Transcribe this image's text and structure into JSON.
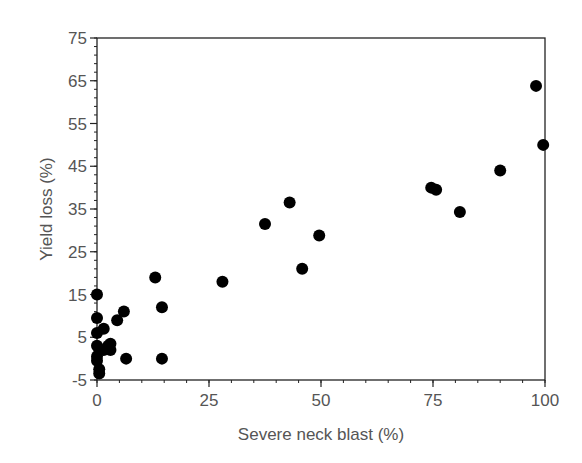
{
  "chart_data": {
    "type": "scatter",
    "title": "",
    "xlabel": "Severe neck blast (%)",
    "ylabel": "Yield loss (%)",
    "xlim": [
      0,
      100
    ],
    "ylim": [
      -5,
      75
    ],
    "x_ticks": [
      0,
      25,
      50,
      75,
      100
    ],
    "y_ticks": [
      -5,
      5,
      15,
      25,
      35,
      45,
      55,
      65,
      75
    ],
    "x_minor_step": 5,
    "y_minor_step": 2,
    "grid": false,
    "legend": null,
    "marker": {
      "shape": "circle",
      "color": "#000000",
      "radius": 6
    },
    "series": [
      {
        "name": "observations",
        "points": [
          {
            "x": 0,
            "y": 15
          },
          {
            "x": 0,
            "y": 9.5
          },
          {
            "x": 0,
            "y": 6
          },
          {
            "x": 1.5,
            "y": 7
          },
          {
            "x": 4.5,
            "y": 9
          },
          {
            "x": 6,
            "y": 11
          },
          {
            "x": 0,
            "y": 3
          },
          {
            "x": 0.5,
            "y": 2
          },
          {
            "x": 1.5,
            "y": 2
          },
          {
            "x": 2.5,
            "y": 3
          },
          {
            "x": 3,
            "y": 3.5
          },
          {
            "x": 3,
            "y": 2
          },
          {
            "x": 0,
            "y": 0.5
          },
          {
            "x": 0,
            "y": -0.5
          },
          {
            "x": 0.5,
            "y": -2.5
          },
          {
            "x": 0.5,
            "y": -3.5
          },
          {
            "x": 6.5,
            "y": 0
          },
          {
            "x": 14.5,
            "y": 0
          },
          {
            "x": 13,
            "y": 19
          },
          {
            "x": 14.5,
            "y": 12
          },
          {
            "x": 28,
            "y": 18
          },
          {
            "x": 37.5,
            "y": 31.5
          },
          {
            "x": 43,
            "y": 36.5
          },
          {
            "x": 45.8,
            "y": 21
          },
          {
            "x": 49.6,
            "y": 28.8
          },
          {
            "x": 74.6,
            "y": 40
          },
          {
            "x": 75.7,
            "y": 39.5
          },
          {
            "x": 81,
            "y": 34.3
          },
          {
            "x": 90,
            "y": 44
          },
          {
            "x": 98,
            "y": 63.8
          },
          {
            "x": 99.6,
            "y": 50
          }
        ]
      }
    ]
  },
  "layout": {
    "plot": {
      "left": 97,
      "top": 38,
      "right": 545,
      "bottom": 380
    },
    "colors": {
      "axis": "#222222",
      "text": "#555555",
      "marker": "#000000"
    }
  }
}
